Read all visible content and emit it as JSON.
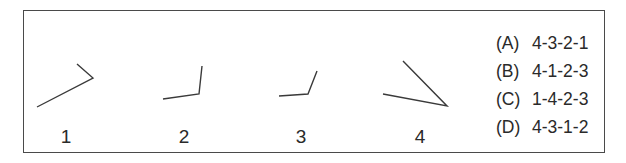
{
  "figures": [
    {
      "label": "1",
      "icon": "bent-line-figure"
    },
    {
      "label": "2",
      "icon": "bent-line-figure"
    },
    {
      "label": "3",
      "icon": "bent-line-figure"
    },
    {
      "label": "4",
      "icon": "bent-line-figure"
    }
  ],
  "options": [
    {
      "letter": "(A)",
      "sequence": "4-3-2-1"
    },
    {
      "letter": "(B)",
      "sequence": "4-1-2-3"
    },
    {
      "letter": "(C)",
      "sequence": "1-4-2-3"
    },
    {
      "letter": "(D)",
      "sequence": "4-3-1-2"
    }
  ],
  "colors": {
    "stroke": "#3a3a3a",
    "text": "#2a2a2a"
  }
}
